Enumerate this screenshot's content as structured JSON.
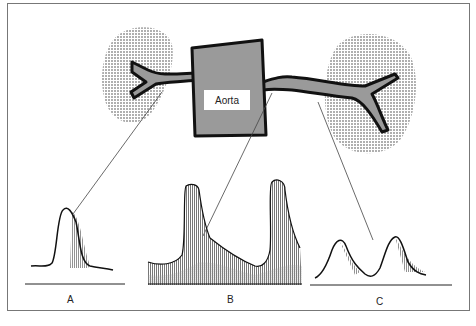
{
  "diagram": {
    "vessel_label": "Aorta",
    "waveform_labels": [
      "A",
      "B",
      "C"
    ],
    "colors": {
      "vessel_fill": "#9a9a9a",
      "vessel_outline": "#111111",
      "kidney_stipple": "#333333",
      "waveform_fill_dark": "#8a8a8a",
      "waveform_fill_light": "#cfcfcf",
      "frame": "#777777"
    }
  }
}
